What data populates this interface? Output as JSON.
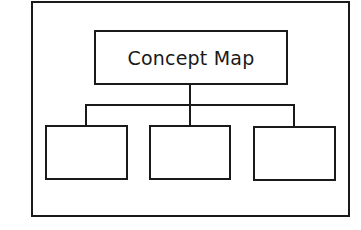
{
  "diagram": {
    "type": "concept-map-hierarchy",
    "root": {
      "label": "Concept Map"
    },
    "children": [
      {
        "label": ""
      },
      {
        "label": ""
      },
      {
        "label": ""
      }
    ],
    "colors": {
      "stroke": "#1a1a1a",
      "background": "#ffffff"
    }
  }
}
